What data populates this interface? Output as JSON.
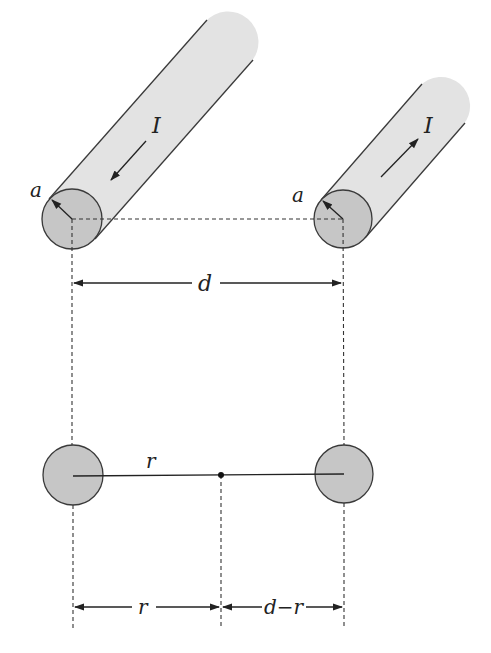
{
  "diagram": {
    "colors": {
      "background": "#ffffff",
      "wire_body": "#e3e3e3",
      "wire_end": "#c6c6c6",
      "outline": "#3a3a3a",
      "line": "#222222"
    },
    "wires": [
      {
        "id": "left",
        "current_label": "I",
        "current_direction": "down-left",
        "radius_label": "a"
      },
      {
        "id": "right",
        "current_label": "I",
        "current_direction": "up-right",
        "radius_label": "a"
      }
    ],
    "labels": {
      "left_radius": "a",
      "right_radius": "a",
      "left_current": "I",
      "right_current": "I",
      "separation": "d",
      "field_point_distance": "r",
      "bottom_left_span": "r",
      "bottom_right_span": "d−r"
    }
  }
}
